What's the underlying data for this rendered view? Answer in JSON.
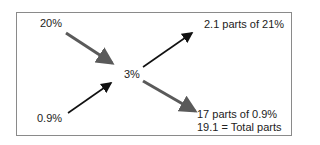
{
  "diagram": {
    "inputs": [
      {
        "label": "20%",
        "arrow_color": "#5a5a5a"
      },
      {
        "label": "0.9%",
        "arrow_color": "#111111"
      }
    ],
    "center": {
      "label": "3%"
    },
    "outputs": [
      {
        "label": "2.1 parts of 21%",
        "arrow_color": "#111111"
      },
      {
        "label": "17 parts of 0.9%",
        "arrow_color": "#5a5a5a"
      }
    ],
    "total": {
      "label": "19.1 = Total parts"
    },
    "colors": {
      "border": "#8a8a8a",
      "dark_arrow": "#111111",
      "gray_arrow": "#5a5a5a",
      "text": "#222222"
    }
  }
}
